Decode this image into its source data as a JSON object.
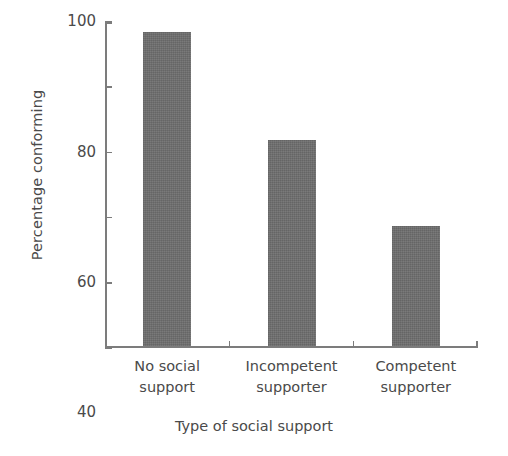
{
  "chart_data": {
    "type": "bar",
    "title": "",
    "categories": [
      "No social support",
      "Incompetent supporter",
      "Competent supporter"
    ],
    "category_lines": [
      [
        "No social",
        "support"
      ],
      [
        "Incompetent",
        "supporter"
      ],
      [
        "Competent",
        "supporter"
      ]
    ],
    "values": [
      96.3,
      63.2,
      36.8
    ],
    "xlabel": "Type of social support",
    "ylabel": "Percentage conforming",
    "ylim": [
      0,
      100
    ],
    "yticks": [
      0,
      20,
      40,
      60,
      80,
      100
    ],
    "ytick_labels": [
      "0",
      "20",
      "40",
      "60",
      "80",
      "100"
    ],
    "grid": false,
    "legend": null,
    "bar_color": "#6e6e6e",
    "axis_color": "#7c7c7c",
    "text_color": "#4a4a4a",
    "background": "#ffffff"
  }
}
